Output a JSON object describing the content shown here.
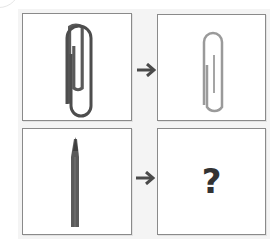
{
  "puzzle": {
    "type": "visual-analogy",
    "rows": [
      {
        "source": {
          "object": "paperclip",
          "size": "large",
          "shade": "dark"
        },
        "arrow": "right-arrow",
        "target": {
          "object": "paperclip",
          "size": "small",
          "shade": "light"
        }
      },
      {
        "source": {
          "object": "pencil",
          "size": "large",
          "shade": "dark"
        },
        "arrow": "right-arrow",
        "target": {
          "object": "unknown",
          "label": "?"
        }
      }
    ],
    "unknown_label": "?"
  },
  "colors": {
    "border": "#8a8a8a",
    "panel": "#f4f4f4",
    "arrow": "#4a4a4a",
    "question": "#333333",
    "paperclip_dark": "#555555",
    "paperclip_light": "#9a9a9a",
    "pencil": "#5a5a5a"
  }
}
